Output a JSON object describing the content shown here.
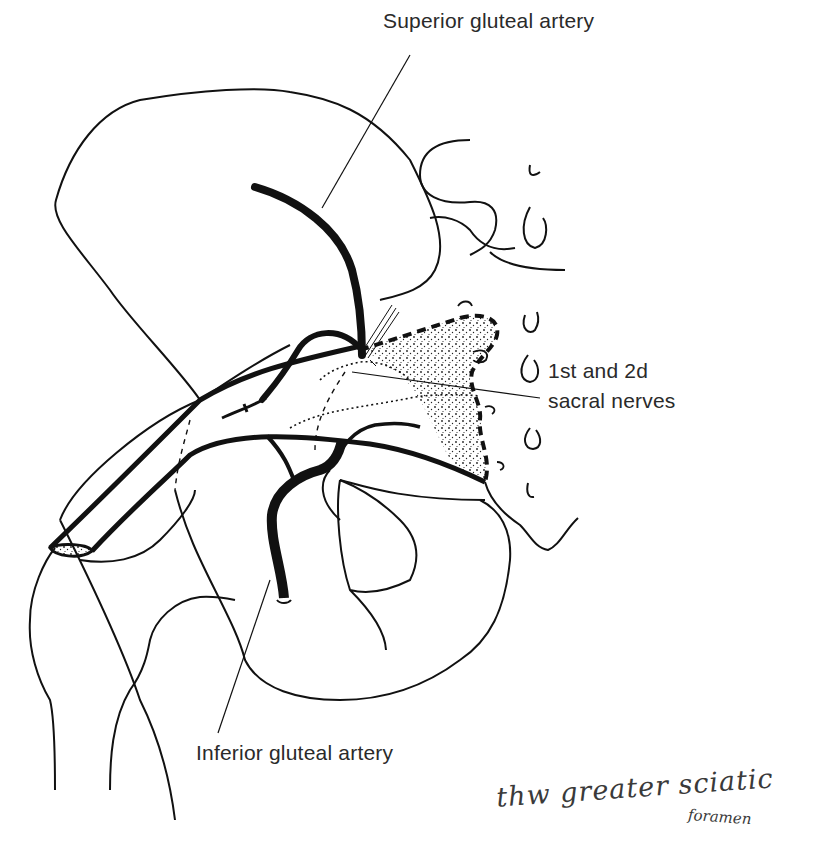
{
  "figure": {
    "type": "anatomical-line-drawing"
  },
  "labels": {
    "superior_gluteal_artery": "Superior gluteal artery",
    "sacral_nerves_line1": "1st and 2d",
    "sacral_nerves_line2": "sacral nerves",
    "inferior_gluteal_artery": "Inferior gluteal artery"
  },
  "handwritten_note": {
    "line1": "thw greater sciatic",
    "line2": "foramen"
  },
  "colors": {
    "ink": "#111111",
    "label_text": "#2a2a2a",
    "background": "#ffffff"
  }
}
